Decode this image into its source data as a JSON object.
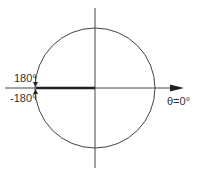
{
  "diagram": {
    "title": "",
    "labels": {
      "upper_angle": "180°",
      "lower_angle": "-180°",
      "zero_angle": "θ=0°"
    },
    "colors": {
      "line": "#444444",
      "thick_line": "#222222",
      "text": "#333333",
      "background": "#ffffff"
    },
    "elements": [
      {
        "name": "unit-circle",
        "type": "circle"
      },
      {
        "name": "vertical-axis",
        "type": "line"
      },
      {
        "name": "horizontal-axis",
        "type": "arrow",
        "direction": "right"
      },
      {
        "name": "branch-cut-line",
        "type": "thick-line",
        "from": "center",
        "to": "180°"
      },
      {
        "name": "arrow-180",
        "type": "arrow",
        "direction": "down"
      },
      {
        "name": "arrow-minus-180",
        "type": "arrow",
        "direction": "up"
      }
    ]
  }
}
